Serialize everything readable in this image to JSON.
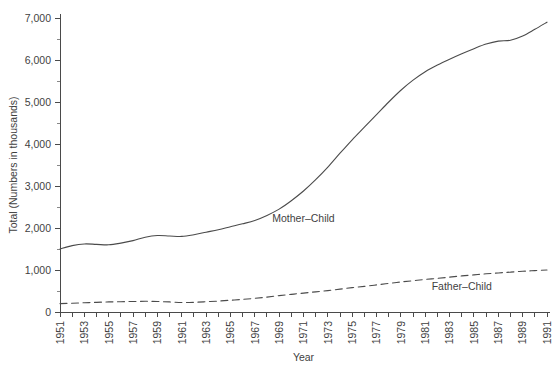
{
  "chart_data": {
    "type": "line",
    "title": "",
    "xlabel": "Year",
    "ylabel": "Total (Numbers in thousands)",
    "xlim": [
      1951,
      1991
    ],
    "ylim": [
      0,
      7000
    ],
    "grid": false,
    "legend": "inline-labels",
    "y_ticks": [
      0,
      1000,
      2000,
      3000,
      4000,
      5000,
      6000,
      7000
    ],
    "y_tick_labels": [
      "0",
      "1,000",
      "2,000",
      "3,000",
      "4,000",
      "5,000",
      "6,000",
      "7,000"
    ],
    "y_minor_ticks": [
      500,
      1500,
      2500,
      3500,
      4500,
      5500,
      6500
    ],
    "x_ticks": [
      1951,
      1952,
      1953,
      1954,
      1955,
      1956,
      1957,
      1958,
      1959,
      1960,
      1961,
      1962,
      1963,
      1964,
      1965,
      1966,
      1967,
      1968,
      1969,
      1970,
      1971,
      1972,
      1973,
      1974,
      1975,
      1976,
      1977,
      1978,
      1979,
      1980,
      1981,
      1982,
      1983,
      1984,
      1985,
      1986,
      1987,
      1988,
      1989,
      1990,
      1991
    ],
    "x_tick_labels": [
      "1951",
      "1953",
      "1955",
      "1957",
      "1959",
      "1961",
      "1963",
      "1965",
      "1967",
      "1969",
      "1971",
      "1973",
      "1975",
      "1977",
      "1979",
      "1981",
      "1983",
      "1985",
      "1987",
      "1989",
      "1991"
    ],
    "x_tick_label_years": [
      1951,
      1953,
      1955,
      1957,
      1959,
      1961,
      1963,
      1965,
      1967,
      1969,
      1971,
      1973,
      1975,
      1977,
      1979,
      1981,
      1983,
      1985,
      1987,
      1989,
      1991
    ],
    "x": [
      1951,
      1952,
      1953,
      1954,
      1955,
      1956,
      1957,
      1958,
      1959,
      1960,
      1961,
      1962,
      1963,
      1964,
      1965,
      1966,
      1967,
      1968,
      1969,
      1970,
      1971,
      1972,
      1973,
      1974,
      1975,
      1976,
      1977,
      1978,
      1979,
      1980,
      1981,
      1982,
      1983,
      1984,
      1985,
      1986,
      1987,
      1988,
      1989,
      1990,
      1991
    ],
    "series": [
      {
        "name": "Mother-Child",
        "label": "Mother–Child",
        "style": "solid",
        "color": "#4b4b4b",
        "label_x": 1971,
        "label_y": 2150,
        "values": [
          1500,
          1580,
          1620,
          1610,
          1600,
          1640,
          1700,
          1780,
          1820,
          1810,
          1800,
          1840,
          1900,
          1960,
          2030,
          2100,
          2180,
          2300,
          2450,
          2650,
          2880,
          3150,
          3450,
          3780,
          4100,
          4400,
          4700,
          5000,
          5280,
          5520,
          5720,
          5880,
          6020,
          6150,
          6270,
          6380,
          6450,
          6470,
          6570,
          6730,
          6900
        ]
      },
      {
        "name": "Father-Child",
        "label": "Father–Child",
        "style": "dashed",
        "color": "#4b4b4b",
        "label_x": 1984,
        "label_y": 520,
        "values": [
          200,
          210,
          220,
          230,
          240,
          245,
          250,
          255,
          250,
          240,
          225,
          230,
          245,
          260,
          280,
          300,
          325,
          355,
          390,
          420,
          450,
          480,
          510,
          545,
          580,
          610,
          645,
          680,
          715,
          745,
          775,
          800,
          830,
          860,
          885,
          910,
          930,
          950,
          970,
          985,
          1000
        ]
      }
    ]
  },
  "footer": {
    "ghost_text": ""
  }
}
